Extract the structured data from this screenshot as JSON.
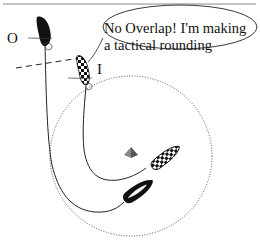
{
  "diagram": {
    "speech_bubble": {
      "line1": "No Overlap! I'm making",
      "line2": "a tactical rounding"
    },
    "labels": {
      "outside_boat": "O",
      "inside_boat": "I"
    },
    "elements": [
      {
        "name": "outside-boat",
        "style": "solid black",
        "role": "O"
      },
      {
        "name": "inside-boat",
        "style": "checkered",
        "role": "I"
      },
      {
        "name": "mark",
        "shape": "pyramid",
        "color": "#7a7a7a"
      },
      {
        "name": "zone-circle",
        "style": "dotted"
      },
      {
        "name": "overlap-line",
        "style": "dashed"
      }
    ],
    "colors": {
      "ink": "#111111",
      "mark": "#7a7a7a",
      "rule": "#888888"
    }
  }
}
